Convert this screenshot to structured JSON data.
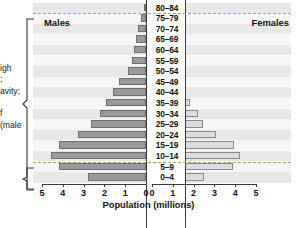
{
  "chart_data": {
    "type": "bar",
    "subtype": "population-pyramid",
    "title": "",
    "xlabel": "Population (millions)",
    "ylabel": "",
    "categories": [
      "80–84",
      "75–79",
      "70–74",
      "65–69",
      "60–64",
      "55–59",
      "50–54",
      "45–49",
      "40–44",
      "35–39",
      "30–34",
      "25–29",
      "20–24",
      "15–19",
      "10–14",
      "5–9",
      "0–4"
    ],
    "series": [
      {
        "name": "Males",
        "side": "left",
        "values": [
          0.1,
          0.25,
          0.4,
          0.5,
          0.6,
          0.65,
          0.85,
          1.3,
          1.6,
          1.9,
          2.2,
          2.65,
          3.25,
          4.2,
          4.55,
          4.2,
          2.8
        ]
      },
      {
        "name": "Females",
        "side": "right",
        "values": [
          0.1,
          0.2,
          0.35,
          0.45,
          0.55,
          0.65,
          0.85,
          1.2,
          1.55,
          1.85,
          2.2,
          2.45,
          3.1,
          3.95,
          4.25,
          3.9,
          2.5
        ]
      }
    ],
    "xticks_left": [
      "5",
      "4",
      "3",
      "2",
      "1",
      "0"
    ],
    "xticks_right": [
      "0",
      "1",
      "2",
      "3",
      "4",
      "5"
    ],
    "xlim": [
      0,
      5
    ],
    "grid": false,
    "legend_position": "inline-top",
    "colors": {
      "male_fill": "#9a9a9a",
      "male_border": "#6f6f6f",
      "female_fill": "#dcdcdc",
      "female_border": "#8a8a8a",
      "band": "#e8e8e8",
      "band_alt": "#f6f6f6",
      "axis": "#3a3a3a",
      "dashed_separator": "#b0a070"
    }
  },
  "labels": {
    "males": "Males",
    "females": "Females",
    "axis_title": "Population (millions)"
  },
  "margin_notes": [
    {
      "text": "igh"
    },
    {
      "text": ";"
    },
    {
      "text": "avity;"
    },
    {
      "text": "f"
    },
    {
      "text": "(male"
    }
  ]
}
